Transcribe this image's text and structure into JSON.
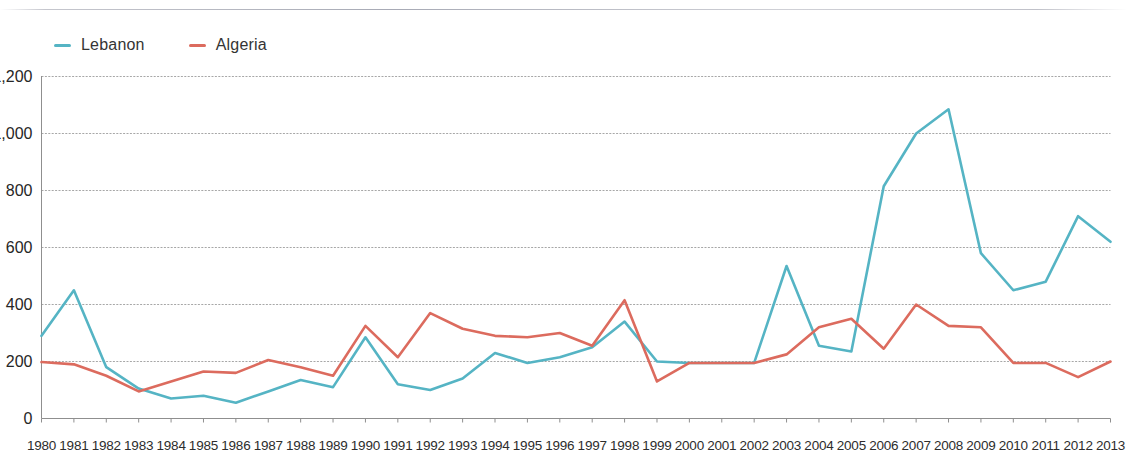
{
  "legend": {
    "position": "top-left",
    "items": [
      {
        "label": "Lebanon",
        "color": "#55B4C4"
      },
      {
        "label": "Algeria",
        "color": "#DC6B5E"
      }
    ]
  },
  "axes": {
    "y_ticks": [
      "0",
      "200",
      "400",
      "600",
      "800",
      "1,000",
      "1,200"
    ],
    "y_min": 0,
    "y_max": 1200,
    "y_step": 200,
    "grid": true
  },
  "chart_data": {
    "type": "line",
    "title": "",
    "subtitle": "",
    "xlabel": "",
    "ylabel": "",
    "ylim": [
      0,
      1200
    ],
    "ytick_step": 200,
    "grid": true,
    "legend_position": "top-left",
    "categories": [
      "1980",
      "1981",
      "1982",
      "1983",
      "1984",
      "1985",
      "1986",
      "1987",
      "1988",
      "1989",
      "1990",
      "1991",
      "1992",
      "1993",
      "1994",
      "1995",
      "1996",
      "1997",
      "1998",
      "1999",
      "2000",
      "2001",
      "2002",
      "2003",
      "2004",
      "2005",
      "2006",
      "2007",
      "2008",
      "2009",
      "2010",
      "2011",
      "2012",
      "2013"
    ],
    "series": [
      {
        "name": "Lebanon",
        "color": "#55B4C4",
        "values": [
          290,
          450,
          180,
          105,
          70,
          80,
          55,
          95,
          135,
          110,
          285,
          120,
          100,
          140,
          230,
          195,
          215,
          250,
          340,
          200,
          195,
          195,
          195,
          535,
          255,
          235,
          815,
          1000,
          1085,
          580,
          450,
          480,
          710,
          620
        ]
      },
      {
        "name": "Algeria",
        "color": "#DC6B5E",
        "values": [
          198,
          190,
          150,
          95,
          130,
          165,
          160,
          205,
          180,
          150,
          325,
          215,
          370,
          315,
          290,
          285,
          300,
          255,
          415,
          130,
          195,
          195,
          195,
          225,
          320,
          350,
          245,
          400,
          325,
          320,
          195,
          195,
          145,
          200
        ]
      }
    ]
  }
}
